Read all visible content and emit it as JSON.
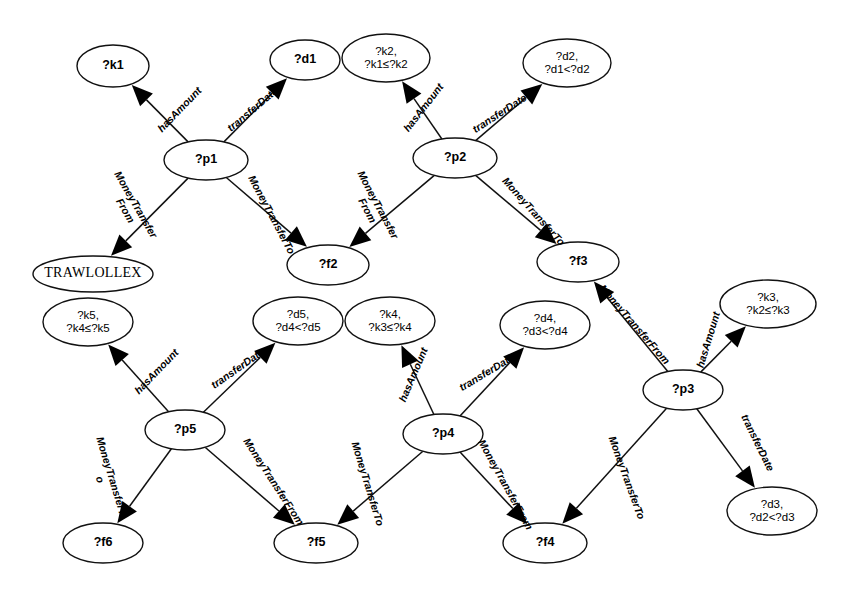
{
  "diagram": {
    "type": "graph-pattern",
    "title": "",
    "background": "#ffffff",
    "stroke_color": "#111111",
    "node_fill": "#ffffff",
    "nodes": [
      {
        "id": "k1",
        "label": "?k1",
        "lines": [
          "?k1"
        ],
        "cx": 113,
        "cy": 66,
        "rx": 36,
        "ry": 21,
        "style": "sans"
      },
      {
        "id": "d1",
        "label": "?d1",
        "lines": [
          "?d1"
        ],
        "cx": 305,
        "cy": 60,
        "rx": 35,
        "ry": 20,
        "style": "sans"
      },
      {
        "id": "k2",
        "label": "?k2, ?k1≤?k2",
        "lines": [
          "?k2,",
          "?k1≤?k2"
        ],
        "cx": 386,
        "cy": 58,
        "rx": 44,
        "ry": 24,
        "style": "sans-small"
      },
      {
        "id": "d2",
        "label": "?d2, ?d1<?d2",
        "lines": [
          "?d2,",
          "?d1<?d2"
        ],
        "cx": 567,
        "cy": 63,
        "rx": 44,
        "ry": 24,
        "style": "sans-small"
      },
      {
        "id": "p1",
        "label": "?p1",
        "lines": [
          "?p1"
        ],
        "cx": 206,
        "cy": 160,
        "rx": 42,
        "ry": 20,
        "style": "sans"
      },
      {
        "id": "p2",
        "label": "?p2",
        "lines": [
          "?p2"
        ],
        "cx": 455,
        "cy": 158,
        "rx": 42,
        "ry": 20,
        "style": "sans"
      },
      {
        "id": "trawlollex",
        "label": "TRAWLOLLEX",
        "lines": [
          "TRAWLOLLEX"
        ],
        "cx": 93,
        "cy": 274,
        "rx": 60,
        "ry": 18,
        "style": "serif"
      },
      {
        "id": "f2",
        "label": "?f2",
        "lines": [
          "?f2"
        ],
        "cx": 328,
        "cy": 265,
        "rx": 41,
        "ry": 20,
        "style": "sans"
      },
      {
        "id": "f3",
        "label": "?f3",
        "lines": [
          "?f3"
        ],
        "cx": 578,
        "cy": 262,
        "rx": 41,
        "ry": 20,
        "style": "sans"
      },
      {
        "id": "k3",
        "label": "?k3, ?k2≤?k3",
        "lines": [
          "?k3,",
          "?k2≤?k3"
        ],
        "cx": 768,
        "cy": 304,
        "rx": 48,
        "ry": 24,
        "style": "sans-small"
      },
      {
        "id": "k5",
        "label": "?k5, ?k4≤?k5",
        "lines": [
          "?k5,",
          "?k4≤?k5"
        ],
        "cx": 88,
        "cy": 322,
        "rx": 45,
        "ry": 24,
        "style": "sans-small"
      },
      {
        "id": "d5",
        "label": "?d5, ?d4<?d5",
        "lines": [
          "?d5,",
          "?d4<?d5"
        ],
        "cx": 298,
        "cy": 321,
        "rx": 45,
        "ry": 24,
        "style": "sans-small"
      },
      {
        "id": "k4",
        "label": "?k4, ?k3≤?k4",
        "lines": [
          "?k4,",
          "?k3≤?k4"
        ],
        "cx": 390,
        "cy": 321,
        "rx": 45,
        "ry": 24,
        "style": "sans-small"
      },
      {
        "id": "d4",
        "label": "?d4, ?d3<?d4",
        "lines": [
          "?d4,",
          "?d3<?d4"
        ],
        "cx": 545,
        "cy": 325,
        "rx": 45,
        "ry": 24,
        "style": "sans-small"
      },
      {
        "id": "p5",
        "label": "?p5",
        "lines": [
          "?p5"
        ],
        "cx": 185,
        "cy": 430,
        "rx": 40,
        "ry": 20,
        "style": "sans"
      },
      {
        "id": "p4",
        "label": "?p4",
        "lines": [
          "?p4"
        ],
        "cx": 443,
        "cy": 434,
        "rx": 40,
        "ry": 20,
        "style": "sans"
      },
      {
        "id": "p3",
        "label": "?p3",
        "lines": [
          "?p3"
        ],
        "cx": 683,
        "cy": 390,
        "rx": 40,
        "ry": 20,
        "style": "sans"
      },
      {
        "id": "d3",
        "label": "?d3, ?d2<?d3",
        "lines": [
          "?d3,",
          "?d2<?d3"
        ],
        "cx": 772,
        "cy": 511,
        "rx": 45,
        "ry": 24,
        "style": "sans-small"
      },
      {
        "id": "f6",
        "label": "?f6",
        "lines": [
          "?f6"
        ],
        "cx": 103,
        "cy": 543,
        "rx": 40,
        "ry": 20,
        "style": "sans"
      },
      {
        "id": "f5",
        "label": "?f5",
        "lines": [
          "?f5"
        ],
        "cx": 316,
        "cy": 543,
        "rx": 42,
        "ry": 20,
        "style": "sans"
      },
      {
        "id": "f4",
        "label": "?f4",
        "lines": [
          "?f4"
        ],
        "cx": 545,
        "cy": 543,
        "rx": 42,
        "ry": 20,
        "style": "sans"
      }
    ],
    "edges": [
      {
        "id": "e1",
        "from": "p1",
        "to": "k1",
        "label": "hasAmount",
        "label_lines": [
          "hasAmount"
        ],
        "lx": 180,
        "ly": 110,
        "rot": -46
      },
      {
        "id": "e2",
        "from": "p1",
        "to": "d1",
        "label": "transferDate",
        "label_lines": [
          "transferDate"
        ],
        "lx": 253,
        "ly": 110,
        "rot": -40
      },
      {
        "id": "e3",
        "from": "p1",
        "to": "trawlollex",
        "label": "MoneyTransferFrom",
        "label_lines": [
          "MoneyTransfer",
          "From"
        ],
        "lx": 130,
        "ly": 208,
        "rot": 60
      },
      {
        "id": "e4",
        "from": "p1",
        "to": "f2",
        "label": "MoneyTransferTo",
        "label_lines": [
          "MoneyTransferTo"
        ],
        "lx": 271,
        "ly": 215,
        "rot": 62
      },
      {
        "id": "e5",
        "from": "p2",
        "to": "k2",
        "label": "hasAmount",
        "label_lines": [
          "hasAmount"
        ],
        "lx": 424,
        "ly": 108,
        "rot": -52
      },
      {
        "id": "e6",
        "from": "p2",
        "to": "d2",
        "label": "transferDate",
        "label_lines": [
          "transferDate"
        ],
        "lx": 500,
        "ly": 114,
        "rot": -33
      },
      {
        "id": "e7",
        "from": "p2",
        "to": "f2",
        "label": "MoneyTransferFrom",
        "label_lines": [
          "MoneyTransfer",
          "From"
        ],
        "lx": 372,
        "ly": 208,
        "rot": 62
      },
      {
        "id": "e8",
        "from": "p2",
        "to": "f3",
        "label": "MoneyTransferTo",
        "label_lines": [
          "MoneyTransferTo"
        ],
        "lx": 533,
        "ly": 212,
        "rot": 48
      },
      {
        "id": "e9",
        "from": "p3",
        "to": "f3",
        "label": "MoneyTransferFrom",
        "label_lines": [
          "MoneyTransferFrom"
        ],
        "lx": 634,
        "ly": 325,
        "rot": 49
      },
      {
        "id": "e10",
        "from": "p3",
        "to": "k3",
        "label": "hasAmount",
        "label_lines": [
          "hasAmount"
        ],
        "lx": 709,
        "ly": 340,
        "rot": -73
      },
      {
        "id": "e11",
        "from": "p3",
        "to": "d3",
        "label": "transferDate",
        "label_lines": [
          "transferDate"
        ],
        "lx": 757,
        "ly": 443,
        "rot": 64
      },
      {
        "id": "e12",
        "from": "p3",
        "to": "f4",
        "label": "MoneyTransferTo",
        "label_lines": [
          "MoneyTransferTo"
        ],
        "lx": 626,
        "ly": 478,
        "rot": 70
      },
      {
        "id": "e13",
        "from": "p5",
        "to": "k5",
        "label": "hasAmount",
        "label_lines": [
          "hasAmount"
        ],
        "lx": 157,
        "ly": 372,
        "rot": -46
      },
      {
        "id": "e14",
        "from": "p5",
        "to": "d5",
        "label": "transferDate",
        "label_lines": [
          "transferDate"
        ],
        "lx": 238,
        "ly": 369,
        "rot": -35
      },
      {
        "id": "e15",
        "from": "p5",
        "to": "f6",
        "label": "MoneyTransferTo",
        "label_lines": [
          "MoneyTransferT",
          "o"
        ],
        "lx": 105,
        "ly": 478,
        "rot": 73
      },
      {
        "id": "e16",
        "from": "p5",
        "to": "f5",
        "label": "MoneyTransferFrom",
        "label_lines": [
          "MoneyTransferFrom"
        ],
        "lx": 273,
        "ly": 482,
        "rot": 57
      },
      {
        "id": "e17",
        "from": "p4",
        "to": "k4",
        "label": "hasAmount",
        "label_lines": [
          "hasAmount"
        ],
        "lx": 414,
        "ly": 375,
        "rot": -67
      },
      {
        "id": "e18",
        "from": "p4",
        "to": "d4",
        "label": "transferDate",
        "label_lines": [
          "transferDate"
        ],
        "lx": 487,
        "ly": 373,
        "rot": -31
      },
      {
        "id": "e19",
        "from": "p4",
        "to": "f5",
        "label": "MoneyTransferTo",
        "label_lines": [
          "MoneyTransferTo"
        ],
        "lx": 367,
        "ly": 484,
        "rot": 73
      },
      {
        "id": "e20",
        "from": "p4",
        "to": "f4",
        "label": "MoneyTransferFrom",
        "label_lines": [
          "MoneyTransferFrom"
        ],
        "lx": 505,
        "ly": 485,
        "rot": 61
      }
    ],
    "relations": [
      "hasAmount",
      "transferDate",
      "MoneyTransferFrom",
      "MoneyTransferTo"
    ],
    "constraints": [
      "?k1≤?k2",
      "?k2≤?k3",
      "?k3≤?k4",
      "?k4≤?k5",
      "?d1<?d2",
      "?d2<?d3",
      "?d3<?d4",
      "?d4<?d5"
    ]
  }
}
